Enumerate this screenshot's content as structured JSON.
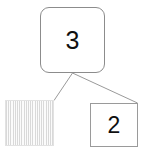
{
  "diagram": {
    "type": "tree",
    "canvas": {
      "width": 145,
      "height": 163,
      "background": "#ffffff"
    },
    "nodes": {
      "root": {
        "label": "3",
        "shape": "rounded-square",
        "border_color": "#8c8c8c",
        "fill": "#ffffff"
      },
      "child_left": {
        "label": "",
        "shape": "square",
        "fill": "hatched-vertical-stripes",
        "hatch_color": "#d9d9d9",
        "border_color": "#e2e2e2"
      },
      "child_right": {
        "label": "2",
        "shape": "square",
        "border_color": "#9a9a9a",
        "fill": "#ffffff"
      }
    },
    "edges": [
      {
        "from": "root",
        "to": "child_left",
        "color": "#9a9a9a"
      },
      {
        "from": "root",
        "to": "child_right",
        "color": "#9a9a9a"
      }
    ]
  }
}
